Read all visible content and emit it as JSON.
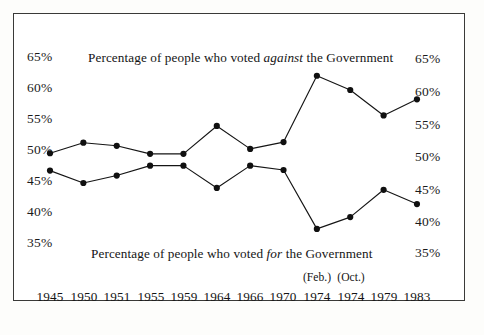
{
  "figure": {
    "background_color": "#fdfdfb",
    "plot_background_color": "#ffffff",
    "frame_color": "#3a3a38",
    "series_color": "#151515"
  },
  "captions": {
    "against_prefix": "Percentage of people who voted ",
    "against_emphasis": "against",
    "against_suffix": " the Government",
    "for_prefix": "Percentage of people who voted ",
    "for_emphasis": "for",
    "for_suffix": " the Government"
  },
  "axis": {
    "left_ticks": [
      "65%",
      "60%",
      "55%",
      "50%",
      "45%",
      "40%",
      "35%"
    ],
    "right_ticks": [
      "65%",
      "60%",
      "55%",
      "50%",
      "45%",
      "40%",
      "35%"
    ]
  },
  "x_labels": [
    {
      "year": "1945",
      "month": ""
    },
    {
      "year": "1950",
      "month": ""
    },
    {
      "year": "1951",
      "month": ""
    },
    {
      "year": "1955",
      "month": ""
    },
    {
      "year": "1959",
      "month": ""
    },
    {
      "year": "1964",
      "month": ""
    },
    {
      "year": "1966",
      "month": ""
    },
    {
      "year": "1970",
      "month": ""
    },
    {
      "year": "1974",
      "month": "(Feb.)"
    },
    {
      "year": "1974",
      "month": "(Oct.)"
    },
    {
      "year": "1979",
      "month": ""
    },
    {
      "year": "1983",
      "month": ""
    }
  ],
  "chart_data": {
    "type": "line",
    "title": "",
    "xlabel": "",
    "ylabel": "",
    "ylim": [
      33,
      66
    ],
    "yticks": [
      35,
      40,
      45,
      50,
      55,
      60,
      65
    ],
    "grid": false,
    "legend": "inline-captions",
    "categories": [
      "1945",
      "1950",
      "1951",
      "1955",
      "1959",
      "1964",
      "1966",
      "1970",
      "1974 (Feb.)",
      "1974 (Oct.)",
      "1979",
      "1983"
    ],
    "series": [
      {
        "name": "Percentage of people who voted against the Government",
        "values": [
          49.8,
          51.5,
          51.0,
          49.7,
          49.7,
          54.2,
          50.5,
          51.6,
          62.3,
          60.0,
          55.9,
          58.5
        ]
      },
      {
        "name": "Percentage of people who voted for the Government",
        "values": [
          47.0,
          45.0,
          46.2,
          47.8,
          47.8,
          44.2,
          47.8,
          47.1,
          37.6,
          39.5,
          43.9,
          41.6
        ]
      }
    ]
  }
}
